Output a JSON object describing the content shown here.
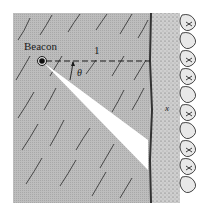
{
  "figure": {
    "labels": {
      "beacon": "Beacon",
      "distance": "1",
      "angle": "θ",
      "shore_position": "x"
    },
    "colors": {
      "water": "#b8b8b8",
      "sand": "#c9c9c9",
      "beam": "#ffffff",
      "ink": "#1a1a1a",
      "background": "#ffffff"
    },
    "elements": [
      {
        "name": "water",
        "description": "diagonal wave strokes on grey"
      },
      {
        "name": "beacon",
        "description": "dark dot with ring"
      },
      {
        "name": "dashed-line",
        "description": "perpendicular distance to shore"
      },
      {
        "name": "light-beam",
        "description": "white wedge from beacon to shore"
      },
      {
        "name": "angle-arrow",
        "description": "curved arrow indicating θ"
      },
      {
        "name": "shoreline",
        "description": "stippled sand strip"
      },
      {
        "name": "shrubs",
        "description": "bushes along the right edge"
      }
    ]
  }
}
